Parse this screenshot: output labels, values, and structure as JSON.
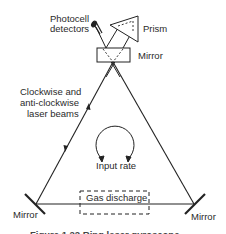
{
  "diagram": {
    "labels": {
      "photocell_line1": "Photocell",
      "photocell_line2": "detectors",
      "prism": "Prism",
      "top_mirror": "Mirror",
      "beams_line1": "Clockwise and",
      "beams_line2": "anti-clockwise",
      "beams_line3": "laser beams",
      "input_rate": "Input rate",
      "gas_discharge": "Gas discharge",
      "left_mirror": "Mirror",
      "right_mirror": "Mirror"
    },
    "caption": "Figure 1.22 Ring laser gyroscope",
    "colors": {
      "line": "#222222",
      "text": "#2a2a2a",
      "background": "#ffffff"
    }
  }
}
